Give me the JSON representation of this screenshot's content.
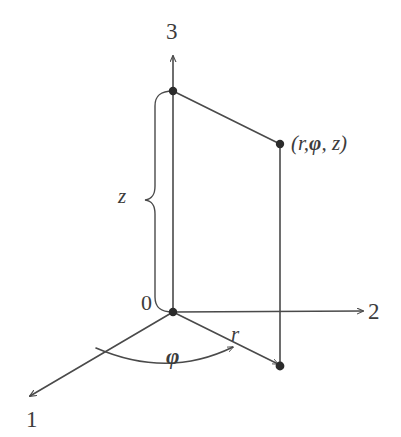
{
  "figure": {
    "background_color": "#ffffff",
    "stroke_color": "#4a4a4a",
    "text_color": "#3c3c3c"
  },
  "axes": [
    {
      "id": "axis-1",
      "label": "1",
      "label_x": 26,
      "label_y": 408,
      "direction": "lower-left"
    },
    {
      "id": "axis-2",
      "label": "2",
      "label_x": 368,
      "label_y": 300,
      "direction": "right"
    },
    {
      "id": "axis-3",
      "label": "3",
      "label_x": 166,
      "label_y": 20,
      "direction": "up"
    }
  ],
  "origin": {
    "label": "0",
    "label_x": 141,
    "label_y": 292,
    "x": 173,
    "y": 312
  },
  "labels": {
    "z": "z",
    "z_x": 118,
    "z_y": 186,
    "r": "r",
    "r_x": 231,
    "r_y": 324,
    "phi": "φ",
    "phi_x": 166,
    "phi_y": 345,
    "point_open": "(",
    "point_r": "r",
    "point_comma1": ",",
    "point_phi": "φ",
    "point_comma2": ", ",
    "point_z": "z",
    "point_close": ")",
    "point_full": "(r,φ, z)",
    "point_x": 291,
    "point_y": 133
  },
  "geometry": {
    "origin": {
      "x": 173,
      "y": 312
    },
    "z_axis_top_arrow": {
      "x": 173,
      "y": 55
    },
    "z_top_point": {
      "x": 173,
      "y": 91
    },
    "axis2_arrow": {
      "x": 365,
      "y": 311
    },
    "axis1_arrow": {
      "x": 27,
      "y": 398
    },
    "space_point": {
      "x": 280,
      "y": 144
    },
    "ground_point": {
      "x": 280,
      "y": 366
    },
    "brace": {
      "top_y": 91,
      "bottom_y": 312,
      "spine_x": 155,
      "tip_x": 145,
      "tip_y": 200
    },
    "arc_start": {
      "x": 98,
      "y": 347
    },
    "arc_end": {
      "x": 235,
      "y": 348
    }
  },
  "points": [
    {
      "name": "point-origin",
      "x": 173,
      "y": 312
    },
    {
      "name": "point-z-top",
      "x": 173,
      "y": 91
    },
    {
      "name": "point-space",
      "x": 280,
      "y": 144
    },
    {
      "name": "point-ground",
      "x": 280,
      "y": 366
    }
  ]
}
